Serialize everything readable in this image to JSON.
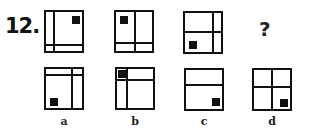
{
  "question": {
    "number": "12.",
    "unknown": "?"
  },
  "sequence": [
    {
      "id": "fig1",
      "description": "vertical line near left, horizontal line near bottom, black square top-right"
    },
    {
      "id": "fig2",
      "description": "vertical line center, horizontal line near bottom, black square top-left"
    },
    {
      "id": "fig3",
      "description": "vertical line near right, horizontal line center, black square bottom-left"
    }
  ],
  "options": [
    {
      "label": "a",
      "description": "horizontal line near top, vertical line right of center, black square bottom-left"
    },
    {
      "label": "b",
      "description": "vertical line near left, horizontal line near top, black square top-left"
    },
    {
      "label": "c",
      "description": "horizontal line upper third, black square bottom-right"
    },
    {
      "label": "d",
      "description": "vertical and horizontal center lines, black square bottom-right"
    }
  ]
}
